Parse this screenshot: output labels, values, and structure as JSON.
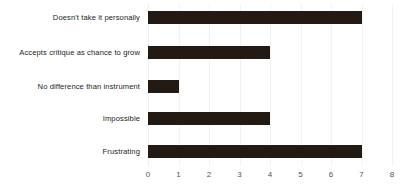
{
  "chart_data": {
    "type": "bar",
    "orientation": "horizontal",
    "title": "",
    "subtitle": "",
    "xlabel": "",
    "ylabel": "",
    "categories": [
      "Doesn't take it personally",
      "Accepts critique as chance to grow",
      "No difference than instrument",
      "Impossible",
      "Frustrating"
    ],
    "values": [
      7,
      4,
      1,
      4,
      7
    ],
    "xlim": [
      0,
      8
    ],
    "xticks": [
      0,
      1,
      2,
      3,
      4,
      5,
      6,
      7,
      8
    ],
    "xtick_labels": [
      "0",
      "1",
      "2",
      "3",
      "4",
      "5",
      "6",
      "7",
      "8"
    ],
    "grid": true,
    "grid_axis": "x",
    "legend": false,
    "bar_color": "#241a14",
    "grid_color": "#f2f2f2",
    "background_color": "#ffffff",
    "label_color": "#221d1a",
    "tick_color": "#55504d"
  }
}
